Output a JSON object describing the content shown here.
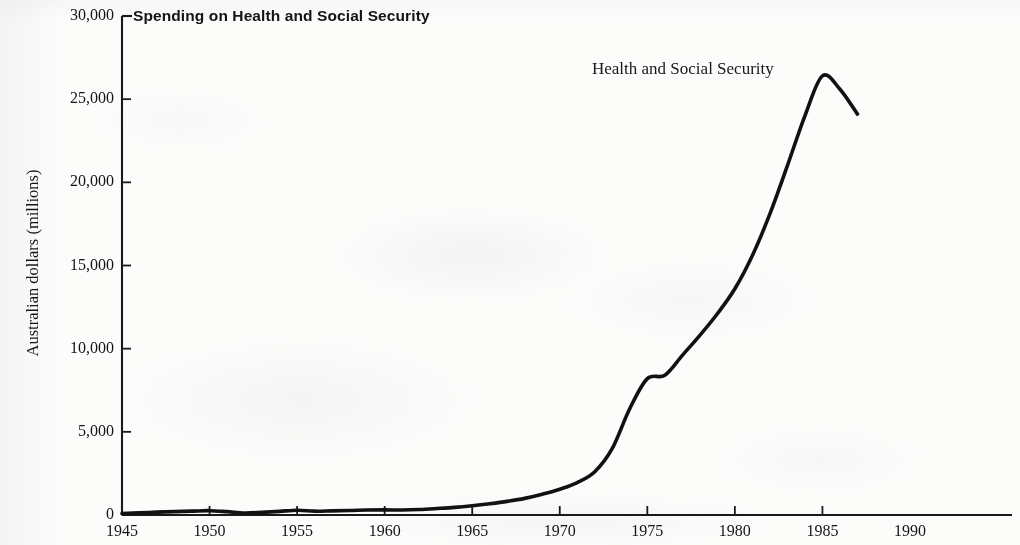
{
  "chart_data": {
    "type": "line",
    "title": "Spending on Health and Social Security",
    "xlabel": "",
    "ylabel": "Australian dollars (millions)",
    "xlim": [
      1945,
      1992
    ],
    "ylim": [
      0,
      30000
    ],
    "grid": false,
    "legend_position": "inline-annotation",
    "annotations": [
      {
        "text": "Health and Social Security",
        "x": 1971,
        "y": 27200
      }
    ],
    "xticks": [
      1945,
      1950,
      1955,
      1960,
      1965,
      1970,
      1975,
      1980,
      1985,
      1990
    ],
    "xtick_labels": [
      "1945",
      "1950",
      "1955",
      "1960",
      "1965",
      "1970",
      "1975",
      "1980",
      "1985",
      "1990"
    ],
    "yticks": [
      0,
      5000,
      10000,
      15000,
      20000,
      25000,
      30000
    ],
    "ytick_labels": [
      "0",
      "5,000",
      "10,000",
      "15,000",
      "20,000",
      "25,000",
      "30,000"
    ],
    "series": [
      {
        "name": "Health and Social Security",
        "color": "#111111",
        "x": [
          1945,
          1946,
          1947,
          1948,
          1949,
          1950,
          1951,
          1952,
          1953,
          1954,
          1955,
          1956,
          1957,
          1958,
          1959,
          1960,
          1961,
          1962,
          1963,
          1964,
          1965,
          1966,
          1967,
          1968,
          1969,
          1970,
          1971,
          1972,
          1973,
          1974,
          1975,
          1976,
          1977,
          1978,
          1979,
          1980,
          1981,
          1982,
          1983,
          1984,
          1985,
          1986,
          1987
        ],
        "values": [
          80,
          130,
          170,
          200,
          230,
          260,
          200,
          120,
          160,
          220,
          290,
          230,
          250,
          270,
          300,
          310,
          300,
          330,
          390,
          460,
          560,
          680,
          820,
          1000,
          1250,
          1550,
          1950,
          2600,
          4000,
          6400,
          8200,
          8400,
          9600,
          10800,
          12100,
          13600,
          15600,
          18100,
          21000,
          24000,
          26400,
          25600,
          24100
        ]
      }
    ]
  },
  "axis": {
    "ylabel": "Australian dollars (millions)"
  }
}
